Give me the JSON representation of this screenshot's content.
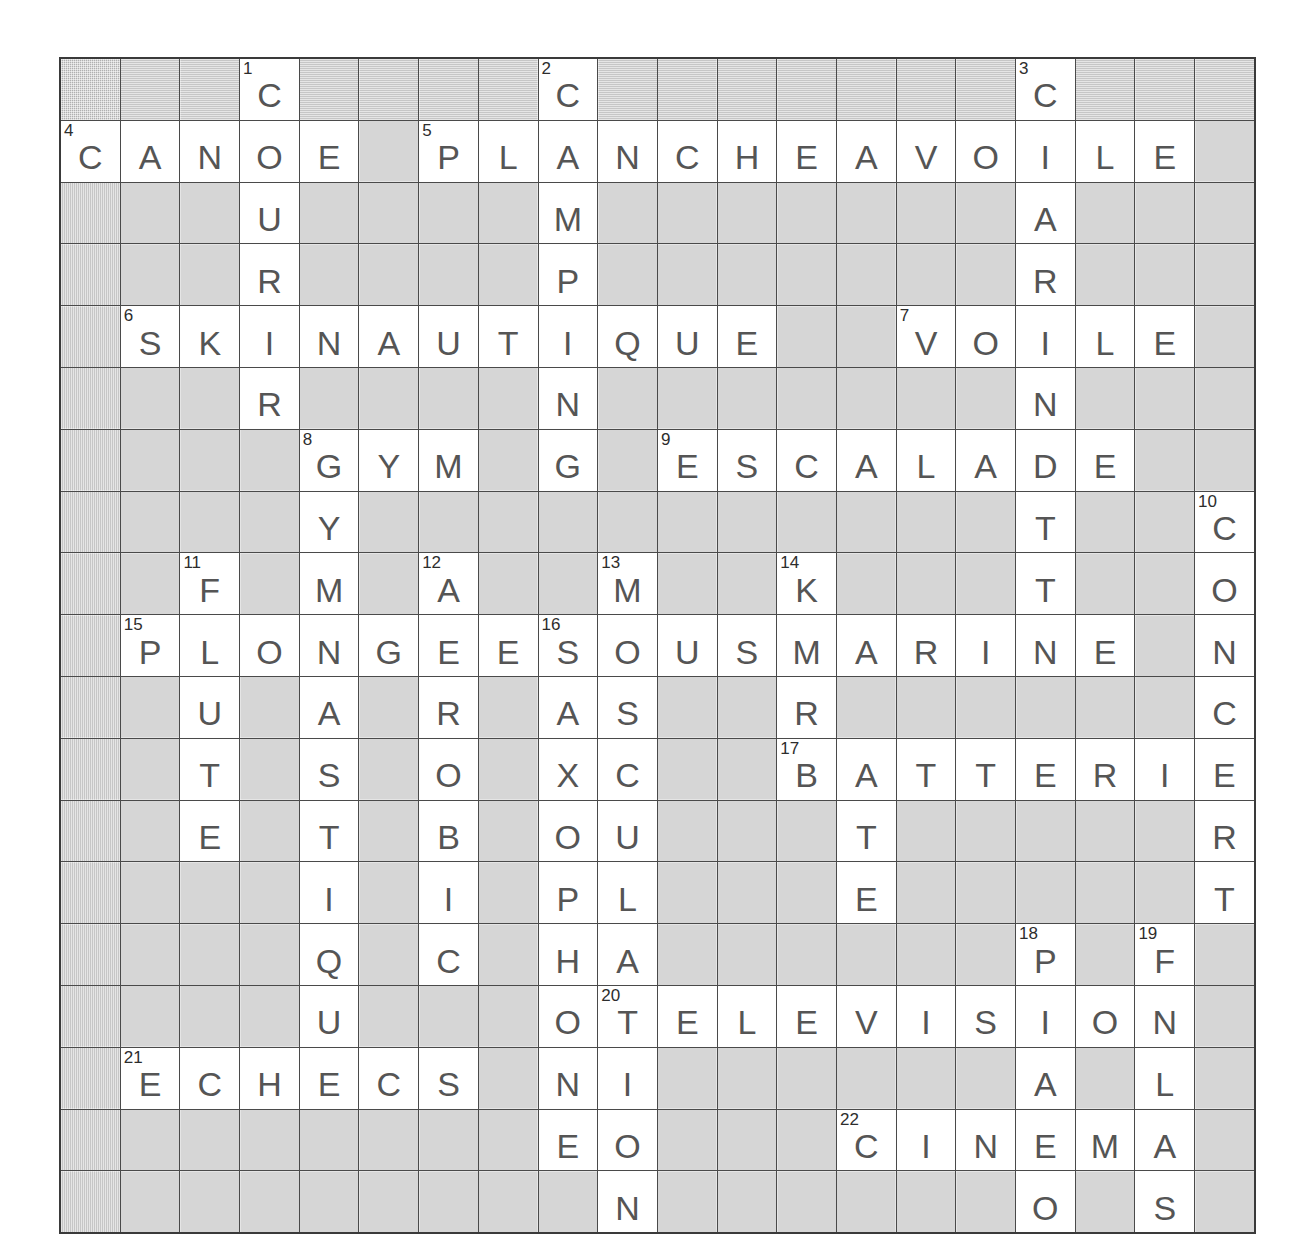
{
  "puzzle": {
    "type": "crossword",
    "language": "fr",
    "theme": "sports-loisirs",
    "rows": 19,
    "cols": 20,
    "colors": {
      "block_fill": "#b0b0b0",
      "cell_fill": "#ffffff",
      "grid_line": "#4a4a4a",
      "letter_color": "#555555",
      "number_color": "#2d2d2d"
    },
    "grid": [
      [
        null,
        null,
        null,
        {
          "n": "1",
          "l": "C"
        },
        null,
        null,
        null,
        null,
        {
          "n": "2",
          "l": "C"
        },
        null,
        null,
        null,
        null,
        null,
        null,
        null,
        {
          "n": "3",
          "l": "C"
        },
        null,
        null,
        null
      ],
      [
        {
          "n": "4",
          "l": "C"
        },
        {
          "l": "A"
        },
        {
          "l": "N"
        },
        {
          "l": "O"
        },
        {
          "l": "E"
        },
        null,
        {
          "n": "5",
          "l": "P"
        },
        {
          "l": "L"
        },
        {
          "l": "A"
        },
        {
          "l": "N"
        },
        {
          "l": "C"
        },
        {
          "l": "H"
        },
        {
          "l": "E"
        },
        {
          "l": "A"
        },
        {
          "l": "V"
        },
        {
          "l": "O"
        },
        {
          "l": "I"
        },
        {
          "l": "L"
        },
        {
          "l": "E"
        },
        null
      ],
      [
        null,
        null,
        null,
        {
          "l": "U"
        },
        null,
        null,
        null,
        null,
        {
          "l": "M"
        },
        null,
        null,
        null,
        null,
        null,
        null,
        null,
        {
          "l": "A"
        },
        null,
        null,
        null
      ],
      [
        null,
        null,
        null,
        {
          "l": "R"
        },
        null,
        null,
        null,
        null,
        {
          "l": "P"
        },
        null,
        null,
        null,
        null,
        null,
        null,
        null,
        {
          "l": "R"
        },
        null,
        null,
        null
      ],
      [
        null,
        {
          "n": "6",
          "l": "S"
        },
        {
          "l": "K"
        },
        {
          "l": "I"
        },
        {
          "l": "N"
        },
        {
          "l": "A"
        },
        {
          "l": "U"
        },
        {
          "l": "T"
        },
        {
          "l": "I"
        },
        {
          "l": "Q"
        },
        {
          "l": "U"
        },
        {
          "l": "E"
        },
        null,
        null,
        {
          "n": "7",
          "l": "V"
        },
        {
          "l": "O"
        },
        {
          "l": "I"
        },
        {
          "l": "L"
        },
        {
          "l": "E"
        },
        null
      ],
      [
        null,
        null,
        null,
        {
          "l": "R"
        },
        null,
        null,
        null,
        null,
        {
          "l": "N"
        },
        null,
        null,
        null,
        null,
        null,
        null,
        null,
        {
          "l": "N"
        },
        null,
        null,
        null
      ],
      [
        null,
        null,
        null,
        null,
        {
          "n": "8",
          "l": "G"
        },
        {
          "l": "Y"
        },
        {
          "l": "M"
        },
        null,
        {
          "l": "G"
        },
        null,
        {
          "n": "9",
          "l": "E"
        },
        {
          "l": "S"
        },
        {
          "l": "C"
        },
        {
          "l": "A"
        },
        {
          "l": "L"
        },
        {
          "l": "A"
        },
        {
          "l": "D"
        },
        {
          "l": "E"
        },
        null,
        null
      ],
      [
        null,
        null,
        null,
        null,
        {
          "l": "Y"
        },
        null,
        null,
        null,
        null,
        null,
        null,
        null,
        null,
        null,
        null,
        null,
        {
          "l": "T"
        },
        null,
        null,
        {
          "n": "10",
          "l": "C"
        }
      ],
      [
        null,
        null,
        {
          "n": "11",
          "l": "F"
        },
        null,
        {
          "l": "M"
        },
        null,
        {
          "n": "12",
          "l": "A"
        },
        null,
        null,
        {
          "n": "13",
          "l": "M"
        },
        null,
        null,
        {
          "n": "14",
          "l": "K"
        },
        null,
        null,
        null,
        {
          "l": "T"
        },
        null,
        null,
        {
          "l": "O"
        }
      ],
      [
        null,
        {
          "n": "15",
          "l": "P"
        },
        {
          "l": "L"
        },
        {
          "l": "O"
        },
        {
          "l": "N"
        },
        {
          "l": "G"
        },
        {
          "l": "E"
        },
        {
          "l": "E"
        },
        {
          "n": "16",
          "l": "S"
        },
        {
          "l": "O"
        },
        {
          "l": "U"
        },
        {
          "l": "S"
        },
        {
          "l": "M"
        },
        {
          "l": "A"
        },
        {
          "l": "R"
        },
        {
          "l": "I"
        },
        {
          "l": "N"
        },
        {
          "l": "E"
        },
        null,
        {
          "l": "N"
        }
      ],
      [
        null,
        null,
        {
          "l": "U"
        },
        null,
        {
          "l": "A"
        },
        null,
        {
          "l": "R"
        },
        null,
        {
          "l": "A"
        },
        {
          "l": "S"
        },
        null,
        null,
        {
          "l": "R"
        },
        null,
        null,
        null,
        null,
        null,
        null,
        {
          "l": "C"
        }
      ],
      [
        null,
        null,
        {
          "l": "T"
        },
        null,
        {
          "l": "S"
        },
        null,
        {
          "l": "O"
        },
        null,
        {
          "l": "X"
        },
        {
          "l": "C"
        },
        null,
        null,
        {
          "n": "17",
          "l": "B"
        },
        {
          "l": "A"
        },
        {
          "l": "T"
        },
        {
          "l": "T"
        },
        {
          "l": "E"
        },
        {
          "l": "R"
        },
        {
          "l": "I"
        },
        {
          "l": "E"
        }
      ],
      [
        null,
        null,
        {
          "l": "E"
        },
        null,
        {
          "l": "T"
        },
        null,
        {
          "l": "B"
        },
        null,
        {
          "l": "O"
        },
        {
          "l": "U"
        },
        null,
        null,
        null,
        {
          "l": "T"
        },
        null,
        null,
        null,
        null,
        null,
        {
          "l": "R"
        }
      ],
      [
        null,
        null,
        null,
        null,
        {
          "l": "I"
        },
        null,
        {
          "l": "I"
        },
        null,
        {
          "l": "P"
        },
        {
          "l": "L"
        },
        null,
        null,
        null,
        {
          "l": "E"
        },
        null,
        null,
        null,
        null,
        null,
        {
          "l": "T"
        }
      ],
      [
        null,
        null,
        null,
        null,
        {
          "l": "Q"
        },
        null,
        {
          "l": "C"
        },
        null,
        {
          "l": "H"
        },
        {
          "l": "A"
        },
        null,
        null,
        null,
        null,
        null,
        null,
        {
          "n": "18",
          "l": "P"
        },
        null,
        {
          "n": "19",
          "l": "F"
        },
        null
      ],
      [
        null,
        null,
        null,
        null,
        {
          "l": "U"
        },
        null,
        null,
        null,
        {
          "l": "O"
        },
        {
          "n": "20",
          "l": "T"
        },
        {
          "l": "E"
        },
        {
          "l": "L"
        },
        {
          "l": "E"
        },
        {
          "l": "V"
        },
        {
          "l": "I"
        },
        {
          "l": "S"
        },
        {
          "l": "I"
        },
        {
          "l": "O"
        },
        {
          "l": "N"
        },
        null
      ],
      [
        null,
        {
          "n": "21",
          "l": "E"
        },
        {
          "l": "C"
        },
        {
          "l": "H"
        },
        {
          "l": "E"
        },
        {
          "l": "C"
        },
        {
          "l": "S"
        },
        null,
        {
          "l": "N"
        },
        {
          "l": "I"
        },
        null,
        null,
        null,
        null,
        null,
        null,
        {
          "l": "A"
        },
        null,
        {
          "l": "L"
        },
        null
      ],
      [
        null,
        null,
        null,
        null,
        null,
        null,
        null,
        null,
        {
          "l": "E"
        },
        {
          "l": "O"
        },
        null,
        null,
        null,
        {
          "n": "22",
          "l": "C"
        },
        {
          "l": "I"
        },
        {
          "l": "N"
        },
        {
          "l": "E"
        },
        {
          "l": "M"
        },
        {
          "l": "A"
        },
        null
      ],
      [
        null,
        null,
        null,
        null,
        null,
        null,
        null,
        null,
        null,
        {
          "l": "N"
        },
        null,
        null,
        null,
        null,
        null,
        null,
        {
          "l": "O"
        },
        null,
        {
          "l": "S"
        },
        null
      ]
    ]
  }
}
